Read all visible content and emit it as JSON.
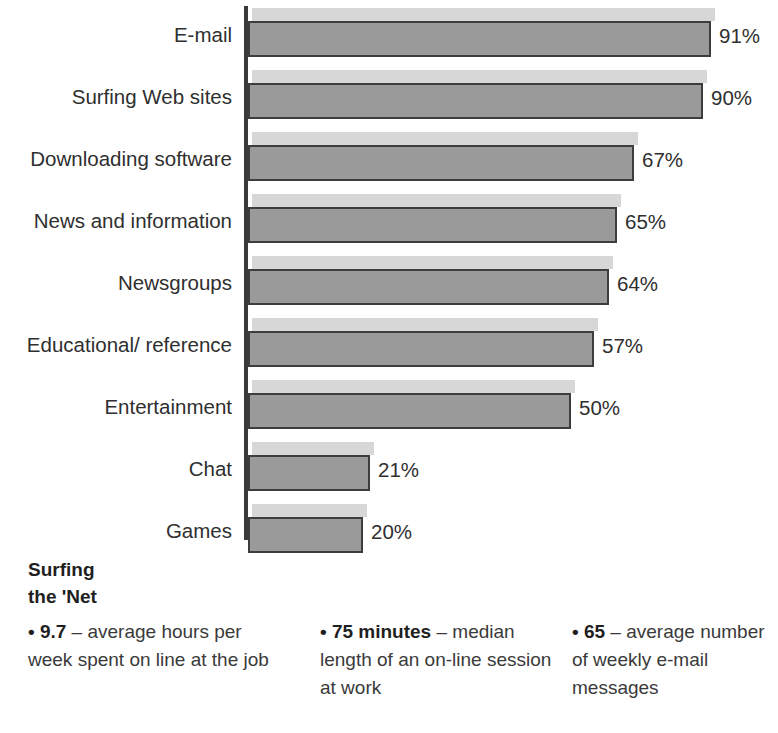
{
  "chart_data": {
    "type": "bar",
    "orientation": "horizontal",
    "title": "",
    "xlabel": "",
    "ylabel": "",
    "grid": false,
    "legend": false,
    "value_suffix": "%",
    "categories": [
      "E-mail",
      "Surfing Web sites",
      "Downloading software",
      "News and information",
      "Newsgroups",
      "Educational/ reference",
      "Entertainment",
      "Chat",
      "Games"
    ],
    "values": [
      91,
      90,
      67,
      65,
      64,
      57,
      50,
      21,
      20
    ],
    "value_labels": [
      "91%",
      "90%",
      "67%",
      "65%",
      "64%",
      "57%",
      "50%",
      "21%",
      "20%"
    ],
    "bar_px": [
      463,
      455,
      386,
      369,
      361,
      346,
      323,
      122,
      115
    ],
    "xlim": [
      0,
      100
    ],
    "colors": {
      "bar_fill": "#9a9a9a",
      "bar_border": "#3d3d3d",
      "bar_shadow": "#d7d7d7",
      "axis": "#3a3a3a",
      "text": "#2f2f2f"
    }
  },
  "footer": {
    "heading": "Surfing\nthe 'Net",
    "facts": [
      {
        "lead": "• 9.7",
        "rest": " – average hours per week spent on line at the job"
      },
      {
        "lead": "• 75 minutes",
        "rest": " – median length of an on-line session at work"
      },
      {
        "lead": "• 65",
        "rest": " – average number of weekly e-mail messages"
      }
    ]
  }
}
